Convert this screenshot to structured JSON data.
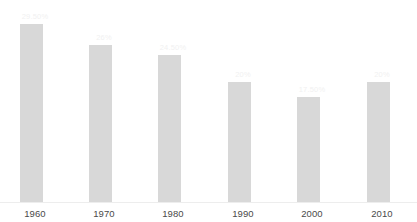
{
  "chart_data": {
    "type": "bar",
    "title": "",
    "subtitle": "",
    "xlabel": "",
    "ylabel": "",
    "grid": false,
    "legend": "none",
    "axis_line": true,
    "ylim": [
      0,
      33.5
    ],
    "categories": [
      "1960",
      "1970",
      "1980",
      "1990",
      "2000",
      "2010"
    ],
    "values": [
      29.5,
      26,
      24.5,
      20,
      17.5,
      20
    ],
    "value_labels": [
      "29.50%",
      "26%",
      "24.50%",
      "20%",
      "17.50%",
      "20%"
    ],
    "series": [
      {
        "name": "",
        "values": [
          29.5,
          26,
          24.5,
          20,
          17.5,
          20
        ]
      }
    ]
  },
  "style": {
    "bar_color": "#d8d8d8",
    "value_label_color": "#f1f1f1",
    "tick_label_color": "#4a4a4a",
    "axis_line_color": "#ededed",
    "background": "#ffffff"
  }
}
